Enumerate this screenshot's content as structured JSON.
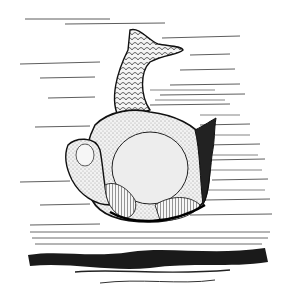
{
  "image": {
    "subject": "engraving of an armored fossil fish (ostracoderm) swimming above the sea floor",
    "style": "black-and-white pen engraving",
    "colors": {
      "ink": "#111111",
      "paper": "#ffffff",
      "mid": "#888888"
    }
  }
}
